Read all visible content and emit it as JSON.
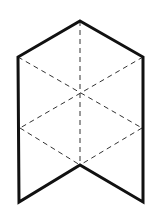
{
  "diagram": {
    "title": "",
    "colors": {
      "background": "#ffffff",
      "outline": "#111111",
      "dashed": "#333333"
    },
    "outline": {
      "stroke_width": 3,
      "points": [
        [
          80,
          21
        ],
        [
          143,
          57
        ],
        [
          143,
          202
        ],
        [
          80,
          165
        ],
        [
          19,
          202
        ],
        [
          18,
          57
        ]
      ]
    },
    "dashed_lines": {
      "stroke_width": 1,
      "dasharray": "5,4",
      "segments": [
        {
          "name": "vertical-center",
          "from": [
            80,
            21
          ],
          "to": [
            80,
            165
          ]
        },
        {
          "name": "top-left-to-right-mid",
          "from": [
            18,
            57
          ],
          "to": [
            142,
            128
          ]
        },
        {
          "name": "top-right-to-left-mid",
          "from": [
            143,
            57
          ],
          "to": [
            20,
            128
          ]
        },
        {
          "name": "left-mid-to-notch",
          "from": [
            20,
            128
          ],
          "to": [
            80,
            165
          ]
        },
        {
          "name": "right-mid-to-notch",
          "from": [
            142,
            128
          ],
          "to": [
            80,
            165
          ]
        }
      ]
    }
  }
}
